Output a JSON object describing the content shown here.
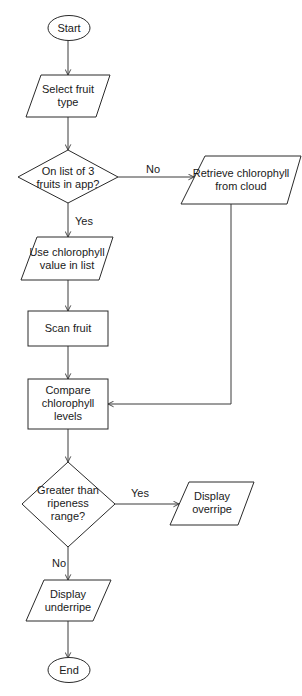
{
  "diagram": {
    "type": "flowchart",
    "nodes": {
      "start": {
        "label": "Start",
        "shape": "terminator"
      },
      "select_fruit": {
        "line1": "Select fruit",
        "line2": "type",
        "shape": "input-output"
      },
      "on_list": {
        "line1": "On list of 3",
        "line2": "fruits in app?",
        "shape": "decision"
      },
      "retrieve": {
        "line1": "Retrieve chlorophyll",
        "line2": "from cloud",
        "shape": "input-output"
      },
      "use_value": {
        "line1": "Use chlorophyll",
        "line2": "value in list",
        "shape": "input-output"
      },
      "scan": {
        "label": "Scan fruit",
        "shape": "process"
      },
      "compare": {
        "line1": "Compare",
        "line2": "chlorophyll",
        "line3": "levels",
        "shape": "process"
      },
      "greater": {
        "line1": "Greater than",
        "line2": "ripeness",
        "line3": "range?",
        "shape": "decision"
      },
      "overripe": {
        "line1": "Display",
        "line2": "overripe",
        "shape": "input-output"
      },
      "underripe": {
        "line1": "Display",
        "line2": "underripe",
        "shape": "input-output"
      },
      "end": {
        "label": "End",
        "shape": "terminator"
      }
    },
    "edges": {
      "on_list_no": "No",
      "on_list_yes": "Yes",
      "greater_yes": "Yes",
      "greater_no": "No"
    }
  }
}
